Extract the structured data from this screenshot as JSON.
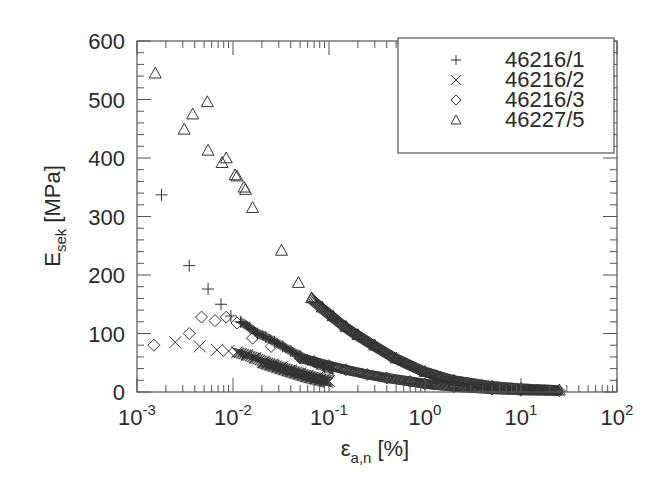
{
  "chart_data": {
    "type": "scatter",
    "title": "",
    "xlabel": "ε_a,n [%]",
    "xlabel_main": "ε",
    "xlabel_sub": "a,n",
    "xlabel_unit": "[%]",
    "ylabel": "E_sek [MPa]",
    "ylabel_main": "E",
    "ylabel_sub": "sek",
    "ylabel_unit": "[MPa]",
    "xscale": "log",
    "xlim": [
      0.001,
      100
    ],
    "ylim": [
      0,
      600
    ],
    "xticks": [
      {
        "base": "10",
        "exp": "-3"
      },
      {
        "base": "10",
        "exp": "-2"
      },
      {
        "base": "10",
        "exp": "-1"
      },
      {
        "base": "10",
        "exp": "0"
      },
      {
        "base": "10",
        "exp": "1"
      },
      {
        "base": "10",
        "exp": "2"
      }
    ],
    "yticks": [
      "0",
      "100",
      "200",
      "300",
      "400",
      "500",
      "600"
    ],
    "grid": false,
    "legend_position": "upper right (boxed)",
    "series": [
      {
        "name": "46216/1",
        "marker": "plus",
        "x": [
          0.0018,
          0.0035,
          0.0055,
          0.0075,
          0.0095,
          0.012,
          0.015,
          0.018,
          0.022,
          0.027,
          0.033,
          0.04,
          0.05,
          0.06,
          0.075,
          0.09,
          0.11
        ],
        "y": [
          337,
          216,
          176,
          150,
          130,
          120,
          110,
          100,
          94,
          86,
          78,
          70,
          62,
          55,
          48,
          42,
          38
        ]
      },
      {
        "name": "46216/2",
        "marker": "x",
        "x": [
          0.0025,
          0.0045,
          0.0068,
          0.009,
          0.011,
          0.014,
          0.017,
          0.021,
          0.026,
          0.032,
          0.04,
          0.05,
          0.06,
          0.075,
          0.09,
          0.1
        ],
        "y": [
          85,
          78,
          72,
          70,
          68,
          63,
          58,
          52,
          47,
          42,
          37,
          32,
          28,
          24,
          21,
          19
        ]
      },
      {
        "name": "46216/3",
        "marker": "diamond",
        "x": [
          0.0015,
          0.0035,
          0.0047,
          0.0065,
          0.0085,
          0.011,
          0.016,
          0.025,
          0.05,
          0.07,
          0.1,
          0.15,
          0.25,
          0.4,
          0.7,
          1.0,
          2.0,
          5.0,
          10.0,
          25.0
        ],
        "y": [
          80,
          100,
          128,
          122,
          128,
          118,
          92,
          78,
          58,
          52,
          45,
          38,
          30,
          24,
          18,
          14,
          9,
          5,
          3,
          2
        ]
      },
      {
        "name": "46227/5",
        "marker": "triangle",
        "x": [
          0.00155,
          0.0031,
          0.0038,
          0.0054,
          0.0055,
          0.0077,
          0.0085,
          0.0105,
          0.011,
          0.013,
          0.0135,
          0.016,
          0.032,
          0.048,
          0.066,
          0.085,
          0.11,
          0.15,
          0.2,
          0.3,
          0.5,
          1.0,
          2.0,
          5.0,
          10.0,
          25.0
        ],
        "y": [
          545,
          449,
          475,
          496,
          413,
          392,
          400,
          371,
          369,
          350,
          346,
          315,
          242,
          187,
          161,
          145,
          130,
          112,
          98,
          80,
          58,
          35,
          20,
          10,
          6,
          3
        ]
      }
    ]
  },
  "legend": {
    "items": [
      {
        "symbol": "+",
        "label": "46216/1"
      },
      {
        "symbol": "×",
        "label": "46216/2"
      },
      {
        "symbol": "◇",
        "label": "46216/3"
      },
      {
        "symbol": "△",
        "label": "46227/5"
      }
    ]
  },
  "colors": {
    "axis": "#555555",
    "marker": "#333333",
    "text": "#2a2a2a",
    "background": "#ffffff"
  }
}
